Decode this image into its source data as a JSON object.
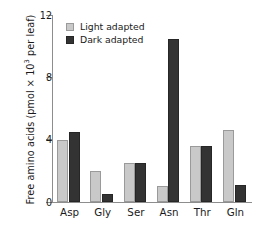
{
  "chart_data": {
    "type": "bar",
    "title": "",
    "xlabel": "",
    "ylabel": "Free amino acids (pmol × 10³ per leaf)",
    "ylabel_prefix": "Free amino acids (pmol × 10",
    "ylabel_exponent": "3",
    "ylabel_suffix": " per leaf)",
    "categories": [
      "Asp",
      "Gly",
      "Ser",
      "Asn",
      "Thr",
      "Gln"
    ],
    "series": [
      {
        "name": "Light adapted",
        "color": "#c9c9c9",
        "values": [
          4.0,
          2.0,
          2.5,
          1.0,
          3.6,
          4.6
        ]
      },
      {
        "name": "Dark adapted",
        "color": "#333333",
        "values": [
          4.5,
          0.5,
          2.5,
          10.5,
          3.6,
          1.1
        ]
      }
    ],
    "ylim": [
      0,
      12
    ],
    "yticks": [
      0,
      4,
      8,
      12
    ],
    "ytick_labels": [
      "0",
      "4",
      "8",
      "12"
    ],
    "grid": false,
    "legend_position": "top-left"
  },
  "legend": {
    "items": [
      {
        "label": "Light adapted",
        "swatch": "light"
      },
      {
        "label": "Dark adapted",
        "swatch": "dark"
      }
    ]
  }
}
